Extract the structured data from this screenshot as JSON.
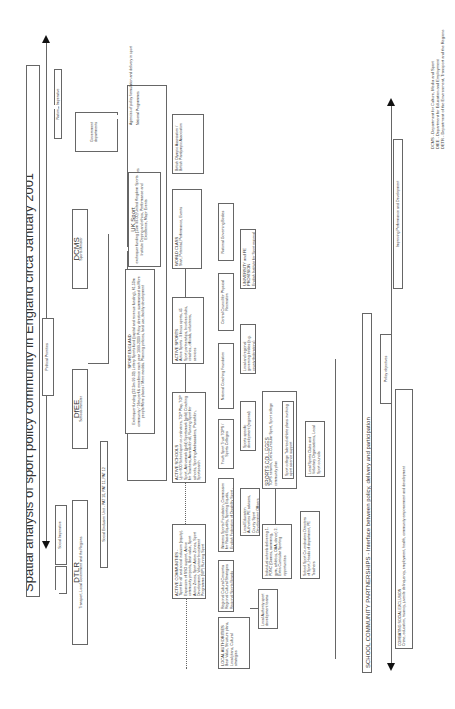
{
  "title": "Spatial analysis of sport policy community in England circa January 2001",
  "axes": {
    "left_arrow_top": "National Imperative",
    "left_arrow_mid": "Political Priorities",
    "left_arrow_bottom": "Social Imperative",
    "bottom_arrow_left": "Improving Performance and Development",
    "bottom_arrow_mid": "Policy objectives",
    "bottom_arrow_right": "COMBATING SOCIAL EXCLUSION",
    "bottom_arrow_right_sub": "Crime, education, truancy, juvenile delinquency, employment, health, community empowerment and development"
  },
  "row_labels": {
    "government": "Government departments",
    "agencies_header": "Agencies of policy formulation and delivery in sport",
    "national_programmes": "National Programmes",
    "national_agencies": "National agencies",
    "regional_agencies": "Regional agencies",
    "local_agencies": "Local agencies"
  },
  "departments": {
    "dcms": {
      "name": "DCMS",
      "sub": "Sports Minister"
    },
    "dfee": {
      "name": "DfEE",
      "sub": "Schools minister"
    },
    "dtlr": {
      "name": "DTLR",
      "sub": "Transport, Local Government and the Regions"
    },
    "seu": "Social Exclusion Unit - PAT 10, PAT 11, PAT 12"
  },
  "boxes": {
    "boa": "British Olympic Association / British Paralympic Association",
    "uk_sport": {
      "title": "UK Sport",
      "body": "exchequer funding (15m 99-00) United Kingdom Sports Institute Doping and ethics, Performance and Excellence, Major Events"
    },
    "sport_england": {
      "title": "SPORT ENGLAND",
      "body": "Exchequer funding (32.3m 99-00) Lottery Sports fund (capital and revenue funding), 61.50m community / 16m perf & excellence each year 1999-2009 Policy direction summarised as More people/More places / More medals. Planning policies, land use, facility development"
    },
    "world_class": {
      "title": "WORLD CLASS",
      "body": "Start, Potential, Performance, Events"
    },
    "active_sports": {
      "title": "ACTIVE SPORTS",
      "body": "Active Sports - 9 focus sports, 45 Sport partnerships, Involves clubs, coaches, officials, volunteers, services"
    },
    "active_schools": {
      "title": "ACTIVE SCHOOLS",
      "body": "Up to 600 School sport co-ordinators, TOP Play, TOP Sport, Activemark (gold) Sportsmark (gold) Coaching for Teachers, Awards for all, Running Sport for schools, Sporting Ambassadors, Panathlon, Sportsearch"
    },
    "active_communities": {
      "title": "ACTIVE COMMUNITIES -",
      "body": "'Sport for all' and social inclusion (equity). Expansion of SSO support, Active community projects, Best value, Sport Action Zones, Sport Action Zones, Sport Development, Volunteer Investment Programme (VIP) Running Sport"
    },
    "ngb": "National Governing Bodies",
    "ccpr": "Central Council for Physical Recreation",
    "ncf": "National Coaching Foundation",
    "yst": "Youth Sport Trust TOPS / Sports Colleges",
    "womens": "Womens Sports Foundation, Commission for Racial Equality, Sporting Equals, English Federation of Disability Sport - policies for tackling social inclusion",
    "regional_cultural": "Regional Cultural Consortia Regional Cultural Strategies Regional Sports Boards",
    "local_authorities": {
      "title": "LOCAL AUTHORITIES",
      "body": "Best Value, Structure plans, Local plans, Cultural strategies"
    },
    "university": {
      "title": "UNIVERSITY and FE PROVISION",
      "body": "English Institute for Sport regional networks, Sport science support, Local academies of sport"
    },
    "local_regional_bodies": "Local and regional governing bodies (e.g. county federations)",
    "sport_specific": "Sports specific development (regional)",
    "lea": "Local Education Authorities PE advisers, County Sport Development Officers",
    "individual_schools": "Individual schools delivering 1. PDNC (Games, swimming, gym, athletics, OAA, dance) 2. Extra Curricular Sporting opportunities",
    "la_sport_dev": "Local Authority sport development teams",
    "sports_colleges": {
      "title": "SPORTS COLLEGES",
      "body": "TOPS network, Extra-Curricular Sport, Sport college community plan"
    },
    "sport_college_talented": "Sport college Talented athlete plans involving sport science support",
    "school_sport_coord": "School Sport Co-ordinators Directors of Sport, Heads of department, PE Teachers",
    "local_clubs": "Local Sports Clubs and Voluntary Organisations, Local Sport councils",
    "school_community": "SCHOOL COMMUNITY PARTNERSHIPS - Interface between policy, delivery and participation"
  },
  "footnotes": [
    "DCMS - Department for Culture, Media and Sport",
    "DfEE - Department for Education and Employment",
    "DETR - Department of the Environment, Transport and the Regions"
  ]
}
